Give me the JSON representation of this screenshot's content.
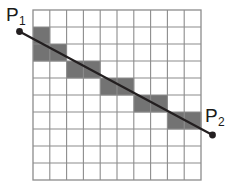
{
  "figure": {
    "name": "line-rasterization-grid",
    "background_color": "#ffffff"
  },
  "grid": {
    "columns": 10,
    "rows": 10,
    "origin_x": 33,
    "origin_y": 10,
    "cell_width": 16.8,
    "cell_height": 17.0,
    "line_color": "#8c8c8c",
    "line_width": 1.1,
    "outer_border_color": "#8c8c8c",
    "outer_border_width": 1.3,
    "cell_fill_empty": "#ffffff",
    "cell_fill_shaded": "#737373",
    "shaded_cells": [
      {
        "col": 0,
        "row": 1
      },
      {
        "col": 0,
        "row": 2
      },
      {
        "col": 1,
        "row": 2
      },
      {
        "col": 2,
        "row": 3
      },
      {
        "col": 3,
        "row": 3
      },
      {
        "col": 4,
        "row": 4
      },
      {
        "col": 5,
        "row": 4
      },
      {
        "col": 6,
        "row": 5
      },
      {
        "col": 7,
        "row": 5
      },
      {
        "col": 8,
        "row": 6
      },
      {
        "col": 9,
        "row": 6
      }
    ]
  },
  "ray": {
    "color": "#231f20",
    "width": 2.2,
    "start": {
      "x": 19.5,
      "y": 31.5
    },
    "end": {
      "x": 212.5,
      "y": 135.0
    }
  },
  "endpoints": [
    {
      "id": "p1",
      "label_base": "P",
      "label_subscript": "1",
      "dot": {
        "x": 19.5,
        "y": 31.5,
        "r": 3.4,
        "color": "#231f20"
      },
      "label_position": {
        "x": 6,
        "y": 21
      },
      "subscript_position": {
        "x": 19,
        "y": 25
      },
      "font_size": 19,
      "subscript_font_size": 12
    },
    {
      "id": "p2",
      "label_base": "P",
      "label_subscript": "2",
      "dot": {
        "x": 212.5,
        "y": 135.0,
        "r": 3.4,
        "color": "#231f20"
      },
      "label_position": {
        "x": 205,
        "y": 122
      },
      "subscript_position": {
        "x": 218,
        "y": 126
      },
      "font_size": 19,
      "subscript_font_size": 12
    }
  ]
}
